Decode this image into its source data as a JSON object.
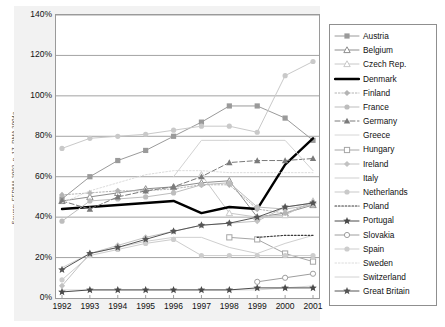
{
  "source_note": "Source: FEDMA 2002, p. 17, DMA 2004a",
  "axes": {
    "y_ticks": [
      "140%",
      "120%",
      "100%",
      "80%",
      "60%",
      "40%",
      "20%",
      "0%"
    ],
    "x_ticks": [
      "1992",
      "1993",
      "1994",
      "1995",
      "1996",
      "1997",
      "1998",
      "1999",
      "2000",
      "2001"
    ]
  },
  "legend": {
    "items": [
      {
        "label": "Austria"
      },
      {
        "label": "Belgium"
      },
      {
        "label": "Czech Rep."
      },
      {
        "label": "Denmark"
      },
      {
        "label": "Finland"
      },
      {
        "label": "France"
      },
      {
        "label": "Germany"
      },
      {
        "label": "Greece"
      },
      {
        "label": "Hungary"
      },
      {
        "label": "Ireland"
      },
      {
        "label": "Italy"
      },
      {
        "label": "Netherlands"
      },
      {
        "label": "Poland"
      },
      {
        "label": "Portugal"
      },
      {
        "label": "Slovakia"
      },
      {
        "label": "Spain"
      },
      {
        "label": "Sweden"
      },
      {
        "label": "Switzerland"
      },
      {
        "label": "Great Britain"
      }
    ]
  },
  "chart_data": {
    "type": "line",
    "title": "",
    "xlabel": "",
    "ylabel": "",
    "ylim": [
      0,
      140
    ],
    "ytick_step": 20,
    "grid": true,
    "legend_position": "right",
    "x": [
      "1992",
      "1993",
      "1994",
      "1995",
      "1996",
      "1997",
      "1998",
      "1999",
      "2000",
      "2001"
    ],
    "series": [
      {
        "name": "Austria",
        "color": "#9a9a9a",
        "marker": "square-filled",
        "dash": "none",
        "width": 1.0,
        "values": [
          49,
          60,
          68,
          73,
          80,
          87,
          95,
          95,
          89,
          78
        ]
      },
      {
        "name": "Belgium",
        "color": "#8e8e8e",
        "marker": "triangle-open",
        "dash": "none",
        "width": 1.0,
        "values": [
          48,
          50,
          52,
          54,
          55,
          57,
          58,
          40,
          42,
          46
        ]
      },
      {
        "name": "Czech Rep.",
        "color": "#c8c8c8",
        "marker": "triangle-open",
        "dash": "none",
        "width": 1.0,
        "values": [
          null,
          null,
          null,
          null,
          null,
          61,
          42,
          40,
          41,
          48
        ]
      },
      {
        "name": "Denmark",
        "color": "#000000",
        "marker": "none",
        "dash": "none",
        "width": 2.4,
        "values": [
          44,
          45,
          46,
          47,
          48,
          42,
          45,
          44,
          66,
          79
        ]
      },
      {
        "name": "Finland",
        "color": "#b4b4b4",
        "marker": "diamond-filled",
        "dash": "dotted",
        "width": 1.0,
        "values": [
          51,
          52,
          53,
          53,
          54,
          56,
          56,
          44,
          42,
          47
        ]
      },
      {
        "name": "France",
        "color": "#bdbdbd",
        "marker": "circle-filled",
        "dash": "none",
        "width": 1.0,
        "values": [
          38,
          48,
          49,
          50,
          52,
          56,
          57,
          45,
          44,
          46
        ]
      },
      {
        "name": "Germany",
        "color": "#7a7a7a",
        "marker": "triangle-filled",
        "dash": "dashed",
        "width": 1.0,
        "values": [
          48,
          44,
          50,
          53,
          55,
          60,
          67,
          68,
          68,
          69
        ]
      },
      {
        "name": "Greece",
        "color": "#d6d6d6",
        "marker": "none",
        "dash": "none",
        "width": 1.0,
        "values": [
          4,
          4,
          4,
          4,
          4,
          4,
          4,
          4,
          5,
          6
        ]
      },
      {
        "name": "Hungary",
        "color": "#a6a6a6",
        "marker": "square-open",
        "dash": "none",
        "width": 1.0,
        "values": [
          null,
          null,
          null,
          null,
          null,
          null,
          30,
          29,
          22,
          18
        ]
      },
      {
        "name": "Ireland",
        "color": "#c2c2c2",
        "marker": "diamond-filled",
        "dash": "none",
        "width": 1.0,
        "values": [
          6,
          22,
          26,
          30,
          33,
          36,
          37,
          38,
          45,
          47
        ]
      },
      {
        "name": "Italy",
        "color": "#cfcfcf",
        "marker": "none",
        "dash": "none",
        "width": 1.0,
        "values": [
          15,
          22,
          25,
          28,
          30,
          30,
          25,
          22,
          27,
          31
        ]
      },
      {
        "name": "Netherlands",
        "color": "#c9c9c9",
        "marker": "circle-filled",
        "dash": "none",
        "width": 1.0,
        "values": [
          74,
          79,
          80,
          81,
          83,
          85,
          85,
          82,
          110,
          117
        ]
      },
      {
        "name": "Poland",
        "color": "#3a3a3a",
        "marker": "none",
        "dash": "dotted",
        "width": 1.2,
        "values": [
          null,
          null,
          null,
          null,
          null,
          null,
          null,
          30,
          31,
          31
        ]
      },
      {
        "name": "Portugal",
        "color": "#4a4a4a",
        "marker": "star-filled",
        "dash": "none",
        "width": 1.0,
        "values": [
          3,
          4,
          4,
          4,
          4,
          4,
          4,
          5,
          5,
          5
        ]
      },
      {
        "name": "Slovakia",
        "color": "#9e9e9e",
        "marker": "circle-open",
        "dash": "none",
        "width": 1.0,
        "values": [
          null,
          null,
          null,
          null,
          null,
          null,
          null,
          8,
          10,
          12
        ]
      },
      {
        "name": "Spain",
        "color": "#cdcdcd",
        "marker": "circle-filled",
        "dash": "none",
        "width": 1.0,
        "values": [
          9,
          21,
          24,
          27,
          29,
          21,
          21,
          21,
          21,
          21
        ]
      },
      {
        "name": "Sweden",
        "color": "#dcdcdc",
        "marker": "none",
        "dash": "dotted",
        "width": 1.0,
        "values": [
          47,
          53,
          57,
          61,
          63,
          63,
          62,
          62,
          62,
          62
        ]
      },
      {
        "name": "Switzerland",
        "color": "#d2d2d2",
        "marker": "none",
        "dash": "none",
        "width": 1.0,
        "values": [
          null,
          null,
          null,
          null,
          60,
          78,
          78,
          78,
          78,
          63
        ]
      },
      {
        "name": "Great Britain",
        "color": "#555555",
        "marker": "star-filled",
        "dash": "none",
        "width": 1.0,
        "values": [
          14,
          22,
          25,
          29,
          33,
          36,
          37,
          40,
          45,
          47
        ]
      }
    ]
  }
}
